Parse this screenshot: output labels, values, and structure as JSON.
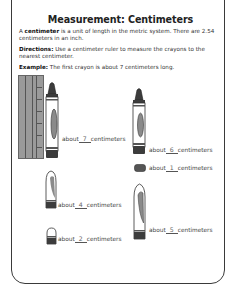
{
  "worksheet": {
    "title": "Measurement: Centimeters",
    "intro": {
      "term": "centimeter",
      "lead": "A ",
      "text": " is a unit of length in the metric system. There are 2.54 centimeters in an inch."
    },
    "directions": {
      "label": "Directions:",
      "text": " Use a centimeter ruler to measure the crayons to the nearest centimeter."
    },
    "example": {
      "label": "Example:",
      "text": " The first crayon is about 7 centimeters long."
    }
  },
  "items": [
    {
      "prefix": "about",
      "answer": "7",
      "suffix": "centimeters"
    },
    {
      "prefix": "about",
      "answer": "6",
      "suffix": "centimeters"
    },
    {
      "prefix": "about",
      "answer": "1",
      "suffix": "centimeters"
    },
    {
      "prefix": "about",
      "answer": "4",
      "suffix": "centimeters"
    },
    {
      "prefix": "about",
      "answer": "5",
      "suffix": "centimeters"
    },
    {
      "prefix": "about",
      "answer": "2",
      "suffix": "centimeters"
    }
  ],
  "colors": {
    "border": "#3a3a3a",
    "crayon_dark": "#3c3c3c",
    "crayon_mid": "#8a8a8a",
    "ruler": "#9a9a9a"
  }
}
